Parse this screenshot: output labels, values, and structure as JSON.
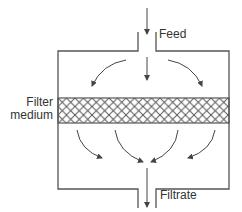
{
  "diagram": {
    "type": "filtration-schematic",
    "labels": {
      "feed": "Feed",
      "filter_line1": "Filter",
      "filter_line2": "medium",
      "filtrate": "Filtrate"
    },
    "colors": {
      "line": "#555555",
      "arrow": "#444444",
      "mesh": "#555555",
      "text": "#333333",
      "background": "#ffffff"
    }
  }
}
